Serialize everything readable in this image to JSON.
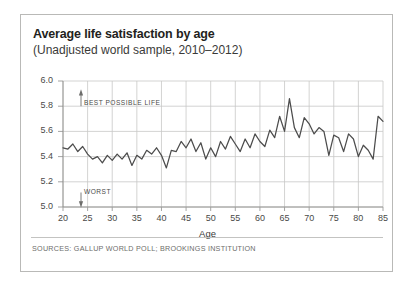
{
  "figure": {
    "title": "Average life satisfaction by age",
    "subtitle": "(Unadjusted world sample, 2010–2012)",
    "source": "SOURCES: GALLUP WORLD POLL; BROOKINGS INSTITUTION",
    "annotation_best": "BEST POSSIBLE LIFE",
    "annotation_worst": "WORST",
    "line_color": "#4c4c4c",
    "grid_color": "#c8c8c6",
    "border_color": "#b9b9b7",
    "text_color": "#231f20"
  },
  "chart_data": {
    "type": "line",
    "title": "Average life satisfaction by age",
    "subtitle": "(Unadjusted world sample, 2010–2012)",
    "xlabel": "Age",
    "ylabel": "",
    "xlim": [
      20,
      85
    ],
    "ylim": [
      5.0,
      6.0
    ],
    "xticks": [
      20,
      25,
      30,
      35,
      40,
      45,
      50,
      55,
      60,
      65,
      70,
      75,
      80,
      85
    ],
    "yticks": [
      5.0,
      5.2,
      5.4,
      5.6,
      5.8,
      6.0
    ],
    "ytick_labels": [
      "5.0",
      "5.2",
      "5.4",
      "5.6",
      "5.8",
      "6.0"
    ],
    "xtick_labels": [
      "20",
      "25",
      "30",
      "35",
      "40",
      "45",
      "50",
      "55",
      "60",
      "65",
      "70",
      "75",
      "80",
      "85"
    ],
    "grid": true,
    "legend": null,
    "annotations": [
      {
        "text": "BEST POSSIBLE LIFE",
        "arrow": "up",
        "y": 5.83
      },
      {
        "text": "WORST",
        "arrow": "down",
        "y": 5.05
      }
    ],
    "x": [
      20,
      21,
      22,
      23,
      24,
      25,
      26,
      27,
      28,
      29,
      30,
      31,
      32,
      33,
      34,
      35,
      36,
      37,
      38,
      39,
      40,
      41,
      42,
      43,
      44,
      45,
      46,
      47,
      48,
      49,
      50,
      51,
      52,
      53,
      54,
      55,
      56,
      57,
      58,
      59,
      60,
      61,
      62,
      63,
      64,
      65,
      66,
      67,
      68,
      69,
      70,
      71,
      72,
      73,
      74,
      75,
      76,
      77,
      78,
      79,
      80,
      81,
      82,
      83,
      84,
      85
    ],
    "values": [
      5.47,
      5.46,
      5.5,
      5.44,
      5.48,
      5.42,
      5.38,
      5.4,
      5.35,
      5.41,
      5.37,
      5.42,
      5.38,
      5.43,
      5.33,
      5.41,
      5.38,
      5.45,
      5.42,
      5.47,
      5.41,
      5.31,
      5.45,
      5.44,
      5.52,
      5.47,
      5.54,
      5.44,
      5.51,
      5.38,
      5.47,
      5.4,
      5.52,
      5.46,
      5.56,
      5.5,
      5.44,
      5.54,
      5.47,
      5.58,
      5.52,
      5.48,
      5.61,
      5.55,
      5.72,
      5.6,
      5.86,
      5.63,
      5.55,
      5.71,
      5.66,
      5.58,
      5.63,
      5.6,
      5.41,
      5.57,
      5.55,
      5.44,
      5.58,
      5.54,
      5.4,
      5.49,
      5.45,
      5.38,
      5.72,
      5.68
    ],
    "series": [
      {
        "name": "Average life satisfaction",
        "values": [
          5.47,
          5.46,
          5.5,
          5.44,
          5.48,
          5.42,
          5.38,
          5.4,
          5.35,
          5.41,
          5.37,
          5.42,
          5.38,
          5.43,
          5.33,
          5.41,
          5.38,
          5.45,
          5.42,
          5.47,
          5.41,
          5.31,
          5.45,
          5.44,
          5.52,
          5.47,
          5.54,
          5.44,
          5.51,
          5.38,
          5.47,
          5.4,
          5.52,
          5.46,
          5.56,
          5.5,
          5.44,
          5.54,
          5.47,
          5.58,
          5.52,
          5.48,
          5.61,
          5.55,
          5.72,
          5.6,
          5.86,
          5.63,
          5.55,
          5.71,
          5.66,
          5.58,
          5.63,
          5.6,
          5.41,
          5.57,
          5.55,
          5.44,
          5.58,
          5.54,
          5.4,
          5.49,
          5.45,
          5.38,
          5.72,
          5.68
        ]
      }
    ]
  }
}
